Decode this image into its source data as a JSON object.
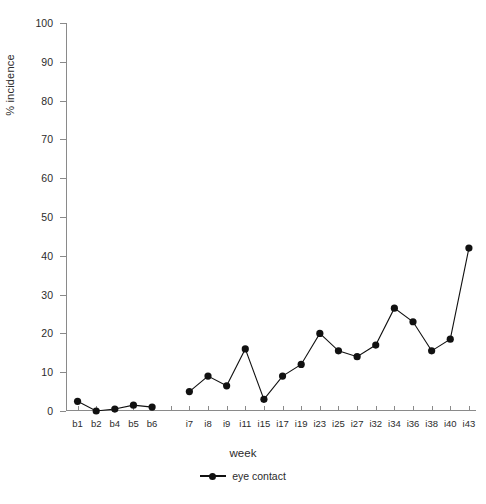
{
  "chart_data": {
    "type": "line",
    "title": "",
    "xlabel": "week",
    "ylabel": "% incidence",
    "ylim": [
      0,
      100
    ],
    "ytick_labels": [
      "0",
      "10",
      "20",
      "30",
      "40",
      "50",
      "60",
      "70",
      "80",
      "90",
      "100"
    ],
    "ytick_values": [
      0,
      10,
      20,
      30,
      40,
      50,
      60,
      70,
      80,
      90,
      100
    ],
    "grid": false,
    "legend_position": "bottom-center",
    "categories": [
      "b1",
      "b2",
      "b4",
      "b5",
      "b6",
      "",
      "i7",
      "i8",
      "i9",
      "i11",
      "i15",
      "i17",
      "i19",
      "i23",
      "i25",
      "i27",
      "i32",
      "i34",
      "i36",
      "i38",
      "i40",
      "i43"
    ],
    "series": [
      {
        "name": "eye contact",
        "marker": "filled-circle",
        "color": "#111111",
        "values": [
          2.5,
          0,
          0.5,
          1.5,
          1,
          null,
          5,
          9,
          6.5,
          16,
          3,
          9,
          12,
          20,
          15.5,
          14,
          17,
          26.5,
          23,
          15.5,
          18.5,
          42
        ]
      }
    ]
  },
  "legend": {
    "entries": [
      {
        "label": "eye contact",
        "marker_icon": "filled-circle-line-marker"
      }
    ]
  },
  "caption": ""
}
